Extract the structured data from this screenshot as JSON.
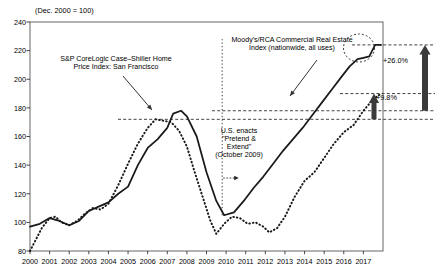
{
  "figure": {
    "units_note": "(Dec. 2000 = 100)",
    "background": "#ffffff",
    "ink": "#000000"
  },
  "annotations": {
    "case_shiller_label": "S&P CoreLogic Case–Shiller Home Price Index: San Francisco",
    "rca_label": "Moody's/RCA Commercial Real Estate Index (nationwide, all uses)",
    "pretend_extend_label": "U.S. enacts \"Pretend & Extend\" (October 2009)",
    "gain_commercial": "+26.0%",
    "gain_housing": "+9.8%"
  },
  "chart_data": {
    "type": "line",
    "title": "",
    "subtitle": "(Dec. 2000 = 100)",
    "xlabel": "",
    "ylabel": "",
    "xlim": [
      2000,
      2018
    ],
    "ylim": [
      80,
      240
    ],
    "yticks": [
      80,
      100,
      120,
      140,
      160,
      180,
      200,
      220,
      240
    ],
    "xticks": [
      2000,
      2001,
      2002,
      2003,
      2004,
      2005,
      2006,
      2007,
      2008,
      2009,
      2010,
      2011,
      2012,
      2013,
      2014,
      2015,
      2016,
      2017
    ],
    "grid": false,
    "legend": "annotations-inline",
    "series": [
      {
        "name": "S&P CoreLogic Case–Shiller Home Price Index: San Francisco",
        "style": "dotted",
        "color": "#1a1a1a",
        "x": [
          2000.0,
          2000.3,
          2000.6,
          2001.0,
          2001.3,
          2001.6,
          2002.0,
          2002.4,
          2002.8,
          2003.2,
          2003.6,
          2004.0,
          2004.5,
          2005.0,
          2005.5,
          2006.0,
          2006.4,
          2006.8,
          2007.2,
          2007.6,
          2008.0,
          2008.4,
          2008.8,
          2009.2,
          2009.5,
          2009.9,
          2010.3,
          2010.7,
          2011.1,
          2011.5,
          2011.9,
          2012.2,
          2012.6,
          2013.0,
          2013.5,
          2014.0,
          2014.5,
          2015.0,
          2015.5,
          2016.0,
          2016.5,
          2017.0,
          2017.5,
          2017.9
        ],
        "y": [
          80,
          88,
          96,
          103,
          104,
          100,
          98,
          101,
          106,
          110,
          109,
          113,
          126,
          141,
          155,
          166,
          172,
          171,
          170,
          164,
          153,
          135,
          118,
          101,
          92,
          99,
          104,
          103,
          99,
          100,
          97,
          93,
          96,
          104,
          118,
          129,
          135,
          145,
          155,
          163,
          168,
          178,
          186,
          190
        ]
      },
      {
        "name": "Moody's/RCA Commercial Real Estate Index (nationwide, all uses)",
        "style": "solid",
        "color": "#1a1a1a",
        "x": [
          2000.0,
          2000.5,
          2001.0,
          2001.5,
          2002.0,
          2002.5,
          2003.0,
          2003.5,
          2004.0,
          2004.5,
          2005.0,
          2005.5,
          2006.0,
          2006.5,
          2007.0,
          2007.3,
          2007.7,
          2008.0,
          2008.5,
          2009.0,
          2009.5,
          2009.9,
          2010.4,
          2010.9,
          2011.4,
          2011.9,
          2012.4,
          2012.9,
          2013.4,
          2013.9,
          2014.4,
          2014.9,
          2015.4,
          2015.9,
          2016.3,
          2016.7,
          2017.0,
          2017.3,
          2017.6,
          2017.9
        ],
        "y": [
          97,
          99,
          103,
          101,
          98,
          101,
          108,
          111,
          114,
          120,
          125,
          140,
          152,
          158,
          166,
          176,
          178,
          174,
          160,
          135,
          115,
          105,
          107,
          115,
          124,
          132,
          141,
          150,
          158,
          166,
          175,
          184,
          193,
          202,
          209,
          214,
          215,
          216,
          224,
          224
        ]
      }
    ],
    "reference_lines": [
      {
        "name": "commercial-prior-peak",
        "value": 178,
        "style": "dashed"
      },
      {
        "name": "housing-prior-peak",
        "value": 172,
        "style": "dashed"
      },
      {
        "name": "commercial-current",
        "value": 224,
        "style": "dashed"
      },
      {
        "name": "housing-current",
        "value": 190,
        "style": "dashed"
      }
    ],
    "event_markers": [
      {
        "name": "pretend-and-extend",
        "x": 2009.8,
        "label": "U.S. enacts \"Pretend & Extend\" (October 2009)"
      }
    ],
    "callouts": [
      {
        "name": "commercial-gain",
        "from": 178,
        "to": 224,
        "value": "+26.0%"
      },
      {
        "name": "housing-gain",
        "from": 172,
        "to": 190,
        "value": "+9.8%"
      }
    ]
  }
}
